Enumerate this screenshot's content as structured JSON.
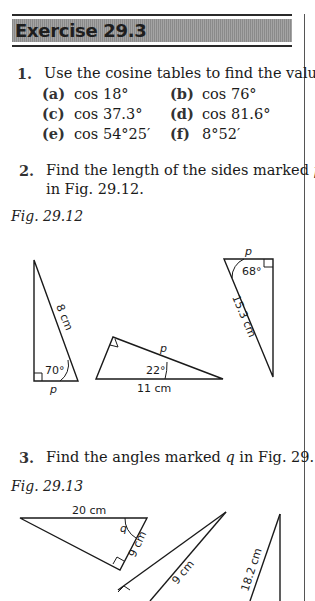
{
  "header": {
    "title": "Exercise 29.3"
  },
  "questions": [
    {
      "number": "1.",
      "text": "Use the cosine tables to find the values of",
      "parts": [
        {
          "label": "(a)",
          "value": "cos 18°"
        },
        {
          "label": "(b)",
          "value": "cos 76°"
        },
        {
          "label": "(c)",
          "value": "cos 37.3°"
        },
        {
          "label": "(d)",
          "value": "cos 81.6°"
        },
        {
          "label": "(e)",
          "value": "cos 54°25′"
        },
        {
          "label": "(f)",
          "value": "8°52′"
        }
      ]
    },
    {
      "number": "2.",
      "text_line1_pre": "Find the length of the sides marked ",
      "text_line1_var": "p",
      "text_line2": "in Fig. 29.12."
    },
    {
      "number": "3.",
      "text_pre": "Find the angles marked ",
      "text_var": "q",
      "text_post": " in Fig. 29.13."
    }
  ],
  "figures": [
    {
      "caption": "Fig. 29.12",
      "triangles": [
        {
          "hypotenuse": "8 cm",
          "angle": "70°",
          "unknown": "p"
        },
        {
          "side": "11 cm",
          "angle": "22°",
          "unknown": "p"
        },
        {
          "hypotenuse": "15.3 cm",
          "angle": "68°",
          "unknown": "p"
        }
      ]
    },
    {
      "caption": "Fig. 29.13",
      "triangles": [
        {
          "side_top": "20 cm",
          "side_right": "9 cm",
          "unknown": "q"
        },
        {
          "side": "9 cm"
        },
        {
          "side": "18.2 cm"
        }
      ]
    }
  ]
}
